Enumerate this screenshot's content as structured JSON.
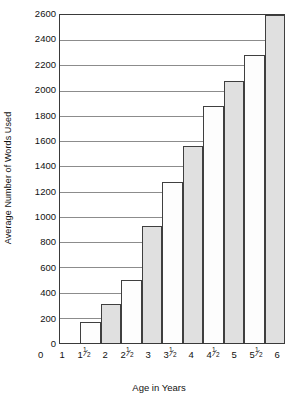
{
  "chart_data": {
    "type": "bar",
    "title": "",
    "xlabel": "Age in Years",
    "ylabel": "Average Number of Words Used",
    "categories": [
      "1",
      "1½",
      "2",
      "2½",
      "3",
      "3½",
      "4",
      "4½",
      "5",
      "5½",
      "6"
    ],
    "category_parts": [
      {
        "whole": "1",
        "num": "",
        "den": ""
      },
      {
        "whole": "1",
        "num": "1",
        "den": "2"
      },
      {
        "whole": "2",
        "num": "",
        "den": ""
      },
      {
        "whole": "2",
        "num": "1",
        "den": "2"
      },
      {
        "whole": "3",
        "num": "",
        "den": ""
      },
      {
        "whole": "3",
        "num": "1",
        "den": "2"
      },
      {
        "whole": "4",
        "num": "",
        "den": ""
      },
      {
        "whole": "4",
        "num": "1",
        "den": "2"
      },
      {
        "whole": "5",
        "num": "",
        "den": ""
      },
      {
        "whole": "5",
        "num": "1",
        "den": "2"
      },
      {
        "whole": "6",
        "num": "",
        "den": ""
      }
    ],
    "values": [
      0,
      170,
      310,
      500,
      930,
      1280,
      1560,
      1880,
      2080,
      2280,
      2600
    ],
    "ylim": [
      0,
      2600
    ],
    "ytick_labels": [
      "0",
      "200",
      "400",
      "600",
      "800",
      "1000",
      "1200",
      "1400",
      "1600",
      "1800",
      "2000",
      "2200",
      "2400",
      "2600"
    ],
    "ytick_values": [
      0,
      200,
      400,
      600,
      800,
      1000,
      1200,
      1400,
      1600,
      1800,
      2000,
      2200,
      2400,
      2600
    ],
    "gridline_values": [
      200,
      400,
      600,
      800,
      1000,
      1200,
      1400,
      1600,
      1800,
      2000,
      2200,
      2400
    ],
    "grid": true,
    "legend": "none",
    "bar_fills": [
      "none",
      "light",
      "gray",
      "light",
      "gray",
      "light",
      "gray",
      "light",
      "gray",
      "light",
      "gray"
    ],
    "colors": {
      "bar_light": "#fdfdfd",
      "bar_gray": "#e0e0e0",
      "bar_border": "#3f3f3f",
      "gridline": "#8c8c8c",
      "axis": "#3a3a3a",
      "text": "#111111",
      "background": "#ffffff"
    }
  }
}
